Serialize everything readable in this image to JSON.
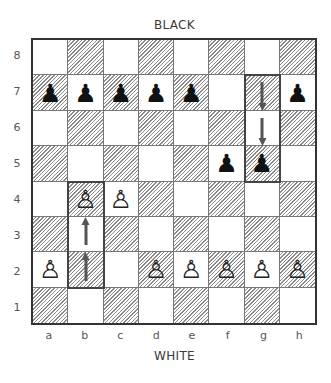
{
  "labels": {
    "top": "BLACK",
    "bottom": "WHITE"
  },
  "ranks": [
    "8",
    "7",
    "6",
    "5",
    "4",
    "3",
    "2",
    "1"
  ],
  "files": [
    "a",
    "b",
    "c",
    "d",
    "e",
    "f",
    "g",
    "h"
  ],
  "pieces": [
    {
      "square": "a7",
      "color": "black",
      "type": "pawn",
      "glyph": "♟"
    },
    {
      "square": "b7",
      "color": "black",
      "type": "pawn",
      "glyph": "♟"
    },
    {
      "square": "c7",
      "color": "black",
      "type": "pawn",
      "glyph": "♟"
    },
    {
      "square": "d7",
      "color": "black",
      "type": "pawn",
      "glyph": "♟"
    },
    {
      "square": "e7",
      "color": "black",
      "type": "pawn",
      "glyph": "♟"
    },
    {
      "square": "h7",
      "color": "black",
      "type": "pawn",
      "glyph": "♟"
    },
    {
      "square": "f5",
      "color": "black",
      "type": "pawn",
      "glyph": "♟"
    },
    {
      "square": "g5",
      "color": "black",
      "type": "pawn",
      "glyph": "♟"
    },
    {
      "square": "b4",
      "color": "white",
      "type": "pawn",
      "glyph": "♙"
    },
    {
      "square": "c4",
      "color": "white",
      "type": "pawn",
      "glyph": "♙"
    },
    {
      "square": "a2",
      "color": "white",
      "type": "pawn",
      "glyph": "♙"
    },
    {
      "square": "d2",
      "color": "white",
      "type": "pawn",
      "glyph": "♙"
    },
    {
      "square": "e2",
      "color": "white",
      "type": "pawn",
      "glyph": "♙"
    },
    {
      "square": "f2",
      "color": "white",
      "type": "pawn",
      "glyph": "♙"
    },
    {
      "square": "g2",
      "color": "white",
      "type": "pawn",
      "glyph": "♙"
    },
    {
      "square": "h2",
      "color": "white",
      "type": "pawn",
      "glyph": "♙"
    }
  ],
  "moves": [
    {
      "from": "b2",
      "to": "b4",
      "direction": "up"
    },
    {
      "from": "g7",
      "to": "g5",
      "direction": "down"
    }
  ]
}
